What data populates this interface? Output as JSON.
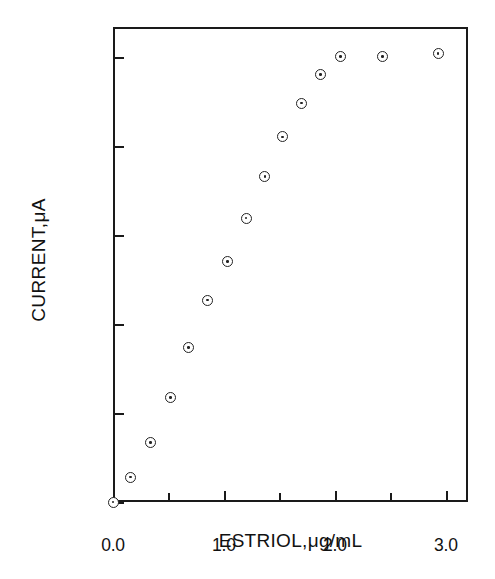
{
  "chart_data": {
    "type": "scatter",
    "title": "",
    "xlabel": "ESTRIOL,μg/mL",
    "ylabel": "CURRENT,μA",
    "xlim": [
      0.0,
      3.2
    ],
    "ylim": [
      0.7,
      1.5
    ],
    "grid": false,
    "legend": null,
    "xticks": [
      0.0,
      1.0,
      2.0,
      3.0
    ],
    "xtick_labels": [
      "0.0",
      "1.0",
      "2.0",
      "3.0"
    ],
    "xminor_ticks": [
      0.5,
      1.5,
      2.5
    ],
    "yticks": [
      0.7,
      0.85,
      1.0,
      1.15,
      1.3,
      1.45
    ],
    "ytick_labels": [
      "0.70",
      "0.85",
      "1.00",
      "1.15",
      "1.30",
      "1.45"
    ],
    "marker": "open-circle-with-center-dot",
    "x": [
      0.0,
      0.16,
      0.34,
      0.52,
      0.68,
      0.85,
      1.03,
      1.2,
      1.37,
      1.53,
      1.7,
      1.87,
      2.05,
      2.43,
      2.93
    ],
    "y": [
      0.7,
      0.742,
      0.8,
      0.876,
      0.96,
      1.04,
      1.105,
      1.178,
      1.248,
      1.315,
      1.372,
      1.42,
      1.45,
      1.45,
      1.455
    ],
    "points": [
      {
        "x": 0.0,
        "y": 0.7
      },
      {
        "x": 0.16,
        "y": 0.742
      },
      {
        "x": 0.34,
        "y": 0.8
      },
      {
        "x": 0.52,
        "y": 0.876
      },
      {
        "x": 0.68,
        "y": 0.96
      },
      {
        "x": 0.85,
        "y": 1.04
      },
      {
        "x": 1.03,
        "y": 1.105
      },
      {
        "x": 1.2,
        "y": 1.178
      },
      {
        "x": 1.37,
        "y": 1.248
      },
      {
        "x": 1.53,
        "y": 1.315
      },
      {
        "x": 1.7,
        "y": 1.372
      },
      {
        "x": 1.87,
        "y": 1.42
      },
      {
        "x": 2.05,
        "y": 1.45
      },
      {
        "x": 2.43,
        "y": 1.45
      },
      {
        "x": 2.93,
        "y": 1.455
      }
    ]
  }
}
